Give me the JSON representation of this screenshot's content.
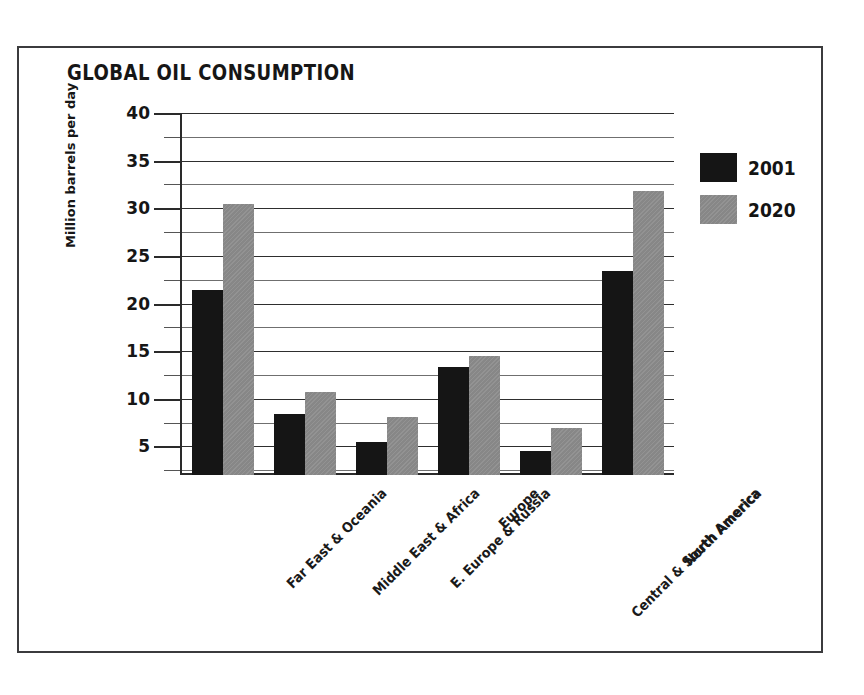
{
  "chart_data": {
    "type": "bar",
    "title": "GLOBAL OIL CONSUMPTION",
    "xlabel": "",
    "ylabel": "Million barrels per day",
    "categories": [
      "Far East & Oceania",
      "Middle East & Africa",
      "E. Europe & Russia",
      "Europe",
      "Central & South America",
      "North America"
    ],
    "series": [
      {
        "name": "2001",
        "color": "#151515",
        "values": [
          21.4,
          8.4,
          5.5,
          13.3,
          4.5,
          23.4
        ]
      },
      {
        "name": "2020",
        "color": "#878787",
        "values": [
          30.5,
          10.7,
          8.1,
          14.5,
          6.9,
          31.8
        ]
      }
    ],
    "ylim": [
      2,
      40
    ],
    "ytick_major": [
      40,
      35,
      30,
      25,
      20,
      15,
      10,
      5
    ],
    "ytick_minor": [
      37.5,
      32.5,
      27.5,
      22.5,
      17.5,
      12.5,
      7.5,
      2.5
    ],
    "grid": true,
    "legend_position": "top-right"
  },
  "legend": {
    "entries": [
      {
        "label": "2001"
      },
      {
        "label": "2020"
      }
    ]
  }
}
